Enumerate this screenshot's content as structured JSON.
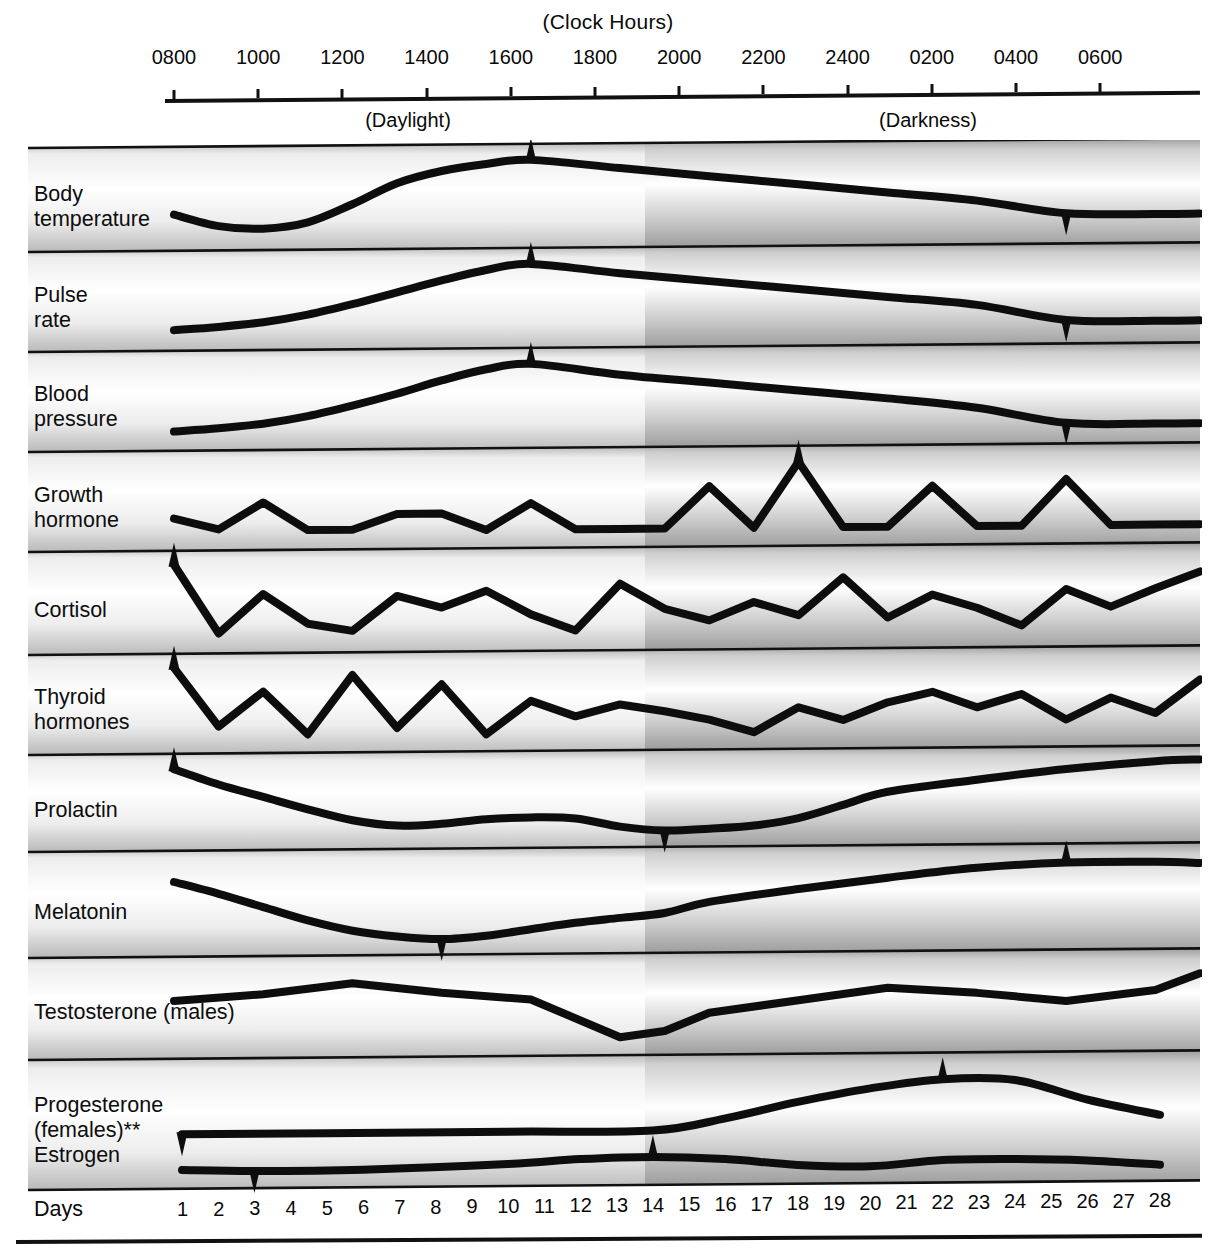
{
  "header": {
    "title": "(Clock Hours)",
    "daylight_label": "(Daylight)",
    "darkness_label": "(Darkness)",
    "hour_ticks": [
      "0800",
      "1000",
      "1200",
      "1400",
      "1600",
      "1800",
      "2000",
      "2200",
      "2400",
      "0200",
      "0400",
      "0600"
    ]
  },
  "axis": {
    "days_label": "Days",
    "day_numbers": [
      "1",
      "2",
      "3",
      "4",
      "5",
      "6",
      "7",
      "8",
      "9",
      "10",
      "11",
      "12",
      "13",
      "14",
      "15",
      "16",
      "17",
      "18",
      "19",
      "20",
      "21",
      "22",
      "23",
      "24",
      "25",
      "26",
      "27",
      "28"
    ]
  },
  "colors": {
    "ink": "#0a0a0a",
    "daylight_band": "#ffffff",
    "darkness_band": "#c8c8c8",
    "band_gradient_edge": "#b4b4b4",
    "band_gradient_center": "#f2f2f2"
  },
  "rows": [
    {
      "name": "body-temperature",
      "label": "Body\ntemperature"
    },
    {
      "name": "pulse-rate",
      "label": "Pulse\nrate"
    },
    {
      "name": "blood-pressure",
      "label": "Blood\npressure"
    },
    {
      "name": "growth-hormone",
      "label": "Growth\nhormone"
    },
    {
      "name": "cortisol",
      "label": "Cortisol"
    },
    {
      "name": "thyroid-hormones",
      "label": "Thyroid\nhormones"
    },
    {
      "name": "prolactin",
      "label": "Prolactin"
    },
    {
      "name": "melatonin",
      "label": "Melatonin"
    },
    {
      "name": "testosterone",
      "label": "Testosterone (males)"
    },
    {
      "name": "progesterone",
      "label": "Progesterone\n(females)**"
    },
    {
      "name": "estrogen",
      "label": "Estrogen"
    }
  ],
  "chart_data": {
    "type": "line",
    "title": "(Clock Hours)",
    "xlabel": "Clock Hours / Days",
    "ylabel": "Relative hormone level (arbitrary units)",
    "grid": false,
    "legend": "none",
    "x_axis_top": {
      "tick_labels": [
        "0800",
        "1000",
        "1200",
        "1400",
        "1600",
        "1800",
        "2000",
        "2200",
        "2400",
        "0200",
        "0400",
        "0600"
      ],
      "daylight_range": [
        "0800",
        "1900"
      ],
      "darkness_range": [
        "1900",
        "0700"
      ]
    },
    "x_axis_bottom": {
      "label": "Days",
      "ticks": [
        1,
        2,
        3,
        4,
        5,
        6,
        7,
        8,
        9,
        10,
        11,
        12,
        13,
        14,
        15,
        16,
        17,
        18,
        19,
        20,
        21,
        22,
        23,
        24,
        25,
        26,
        27,
        28
      ]
    },
    "series": [
      {
        "name": "Body temperature",
        "peak_marker": "1600",
        "trough_marker": "0400",
        "x": [
          "0800",
          "0900",
          "1000",
          "1100",
          "1200",
          "1300",
          "1400",
          "1500",
          "1600",
          "1800",
          "2000",
          "2200",
          "2400",
          "0200",
          "0400",
          "0600",
          "0700"
        ],
        "values": [
          30,
          14,
          10,
          18,
          42,
          70,
          86,
          95,
          100,
          88,
          76,
          64,
          52,
          40,
          22,
          20,
          20
        ]
      },
      {
        "name": "Pulse rate",
        "peak_marker": "1600",
        "trough_marker": "0400",
        "x": [
          "0800",
          "0900",
          "1000",
          "1100",
          "1200",
          "1300",
          "1400",
          "1500",
          "1600",
          "1800",
          "2000",
          "2200",
          "2400",
          "0200",
          "0400",
          "0600",
          "0700"
        ],
        "values": [
          12,
          16,
          22,
          32,
          46,
          62,
          78,
          92,
          100,
          86,
          74,
          62,
          50,
          38,
          16,
          14,
          14
        ]
      },
      {
        "name": "Blood pressure",
        "peak_marker": "1600",
        "trough_marker": "0400",
        "x": [
          "0800",
          "0900",
          "1000",
          "1100",
          "1200",
          "1300",
          "1400",
          "1500",
          "1600",
          "1800",
          "2000",
          "2200",
          "2400",
          "0200",
          "0400",
          "0600",
          "0700"
        ],
        "values": [
          10,
          14,
          20,
          30,
          44,
          60,
          78,
          93,
          100,
          84,
          72,
          60,
          48,
          34,
          12,
          10,
          10
        ]
      },
      {
        "name": "Growth hormone",
        "peak_marker": "2200",
        "x": [
          "0800",
          "0900",
          "1000",
          "1100",
          "1200",
          "1300",
          "1400",
          "1500",
          "1600",
          "1700",
          "1800",
          "1900",
          "2000",
          "2100",
          "2200",
          "2300",
          "2400",
          "0100",
          "0200",
          "0300",
          "0400",
          "0500",
          "0600",
          "0700"
        ],
        "values": [
          26,
          10,
          48,
          8,
          8,
          30,
          30,
          6,
          44,
          6,
          6,
          6,
          66,
          6,
          100,
          6,
          6,
          64,
          6,
          6,
          72,
          6,
          6,
          6
        ]
      },
      {
        "name": "Cortisol",
        "peak_marker": "0800",
        "x": [
          "0800",
          "0900",
          "1000",
          "1100",
          "1200",
          "1300",
          "1400",
          "1500",
          "1600",
          "1700",
          "1800",
          "1900",
          "2000",
          "2100",
          "2200",
          "2300",
          "2400",
          "0100",
          "0200",
          "0300",
          "0400",
          "0500",
          "0600",
          "0700"
        ],
        "values": [
          100,
          8,
          60,
          20,
          10,
          56,
          40,
          62,
          30,
          8,
          70,
          36,
          20,
          44,
          26,
          76,
          22,
          52,
          34,
          10,
          58,
          34,
          58,
          80
        ]
      },
      {
        "name": "Thyroid hormones",
        "peak_marker": "0800",
        "x": [
          "0800",
          "0900",
          "1000",
          "1100",
          "1200",
          "1300",
          "1400",
          "1500",
          "1600",
          "1700",
          "1800",
          "1900",
          "2000",
          "2100",
          "2200",
          "2300",
          "2400",
          "0100",
          "0200",
          "0300",
          "0400",
          "0500",
          "0600",
          "0700"
        ],
        "values": [
          100,
          18,
          66,
          6,
          88,
          14,
          74,
          4,
          50,
          28,
          44,
          34,
          22,
          4,
          38,
          20,
          44,
          58,
          36,
          54,
          18,
          48,
          26,
          72
        ]
      },
      {
        "name": "Prolactin",
        "peak_marker": "0800",
        "trough_marker": "1900",
        "x": [
          "0800",
          "0900",
          "1000",
          "1100",
          "1200",
          "1300",
          "1400",
          "1500",
          "1600",
          "1700",
          "1800",
          "1900",
          "2000",
          "2100",
          "2200",
          "2300",
          "2400",
          "0200",
          "0400",
          "0600",
          "0700"
        ],
        "values": [
          98,
          76,
          58,
          40,
          24,
          16,
          18,
          24,
          26,
          24,
          12,
          6,
          8,
          12,
          22,
          40,
          58,
          74,
          88,
          98,
          100
        ]
      },
      {
        "name": "Melatonin",
        "peak_marker": "0400",
        "trough_marker": "1400",
        "x": [
          "0800",
          "0900",
          "1000",
          "1100",
          "1200",
          "1300",
          "1400",
          "1500",
          "1600",
          "1700",
          "1800",
          "1900",
          "2000",
          "2200",
          "2400",
          "0200",
          "0400",
          "0600",
          "0700"
        ],
        "values": [
          80,
          64,
          46,
          28,
          14,
          6,
          2,
          6,
          14,
          22,
          28,
          34,
          48,
          64,
          78,
          90,
          96,
          96,
          94
        ]
      },
      {
        "name": "Testosterone (males)",
        "x": [
          "0800",
          "1000",
          "1200",
          "1400",
          "1600",
          "1800",
          "1900",
          "2000",
          "2200",
          "2400",
          "0200",
          "0400",
          "0600",
          "0700"
        ],
        "values": [
          62,
          70,
          84,
          70,
          60,
          8,
          16,
          40,
          56,
          72,
          64,
          52,
          66,
          88
        ]
      },
      {
        "name": "Progesterone (females)",
        "peak_marker": "day 22",
        "trough_marker": "day 1",
        "x": [
          "day 1",
          "day 5",
          "day 10",
          "day 14",
          "day 16",
          "day 18",
          "day 20",
          "day 22",
          "day 24",
          "day 26",
          "day 28"
        ],
        "values": [
          20,
          20,
          20,
          20,
          36,
          58,
          76,
          88,
          86,
          58,
          36
        ]
      },
      {
        "name": "Estrogen",
        "peak_marker": "day 14",
        "trough_marker": "day 3",
        "x": [
          "day 1",
          "day 3",
          "day 6",
          "day 10",
          "day 12",
          "day 14",
          "day 16",
          "day 18",
          "day 20",
          "day 22",
          "day 24",
          "day 26",
          "day 28"
        ],
        "values": [
          24,
          16,
          18,
          40,
          62,
          70,
          56,
          24,
          14,
          42,
          44,
          34,
          10
        ]
      }
    ]
  }
}
